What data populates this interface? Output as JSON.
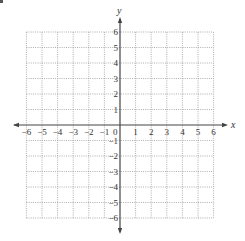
{
  "chart_data": {
    "type": "coordinate-grid",
    "title": "",
    "xlabel": "x",
    "ylabel": "y",
    "xlim": [
      -6,
      6
    ],
    "ylim": [
      -6,
      6
    ],
    "grid": true,
    "grid_style": "dotted",
    "x_ticks": [
      -6,
      -5,
      -4,
      -3,
      -2,
      -1,
      0,
      1,
      2,
      3,
      4,
      5,
      6
    ],
    "x_tick_labels": [
      "−6",
      "−5",
      "−4",
      "−3",
      "−2",
      "−1",
      "0",
      "1",
      "2",
      "3",
      "4",
      "5",
      "6"
    ],
    "y_ticks": [
      6,
      5,
      4,
      3,
      2,
      1,
      -1,
      -2,
      -3,
      -4,
      -5,
      -6
    ],
    "y_tick_labels": [
      "6",
      "5",
      "4",
      "3",
      "2",
      "1",
      "−1",
      "−2",
      "−3",
      "−4",
      "−5",
      "−6"
    ],
    "origin_label": "0",
    "series": []
  },
  "colors": {
    "axis": "#444444",
    "grid": "#9a9a9a",
    "label": "#333333"
  }
}
